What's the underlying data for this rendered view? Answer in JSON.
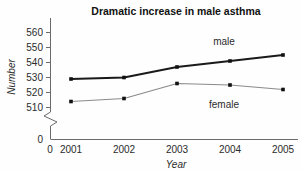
{
  "chart_data": {
    "type": "line",
    "title": "Dramatic increase in male asthma",
    "xlabel": "Year",
    "ylabel": "Number",
    "categories": [
      "2001",
      "2002",
      "2003",
      "2004",
      "2005"
    ],
    "x_tick_labels": [
      "0",
      "2001",
      "2002",
      "2003",
      "2004",
      "2005"
    ],
    "y_tick_labels": [
      "0",
      "510",
      "520",
      "530",
      "540",
      "550",
      "560"
    ],
    "ylim": [
      510,
      560
    ],
    "y_axis_break": true,
    "y_axis_break_note": "zigzag break between 0 and 510",
    "grid": false,
    "legend_position": "inline-annotations",
    "series": [
      {
        "name": "male",
        "label": "male",
        "color": "#1a1a1a",
        "values": [
          529,
          530,
          537,
          541,
          545
        ]
      },
      {
        "name": "female",
        "label": "female",
        "color": "#8a8a8a",
        "values": [
          514,
          516,
          526,
          525,
          522
        ]
      }
    ],
    "annotations": [
      {
        "text": "male",
        "series": "male"
      },
      {
        "text": "female",
        "series": "female"
      }
    ]
  }
}
